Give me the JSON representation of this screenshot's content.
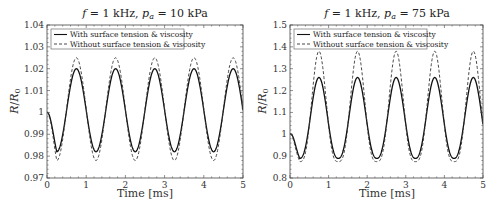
{
  "chart_data": [
    {
      "type": "line",
      "title": "f = 1 kHz, p_a = 10 kPa",
      "title_parts": {
        "f": "f",
        "eq1": " = 1 kHz, ",
        "p": "p",
        "sub": "a",
        "eq2": " = 10 kPa"
      },
      "xlabel": "Time [ms]",
      "ylabel": "R/R0",
      "ylabel_parts": {
        "R": "R",
        "slash": "/",
        "R0": "R",
        "sub": "0"
      },
      "xlim": [
        0,
        5
      ],
      "ylim": [
        0.97,
        1.04
      ],
      "xticks": [
        0,
        1,
        2,
        3,
        4,
        5
      ],
      "xtick_labels": [
        "0",
        "1",
        "2",
        "3",
        "4",
        "5"
      ],
      "yticks": [
        0.97,
        0.98,
        0.99,
        1.0,
        1.01,
        1.02,
        1.03,
        1.04
      ],
      "ytick_labels": [
        "0.97",
        "0.98",
        "0.99",
        "1",
        "1.01",
        "1.02",
        "1.03",
        "1.04"
      ],
      "grid": false,
      "legend_position": "upper left",
      "frequency_khz": 1,
      "period_ms": 1,
      "series": [
        {
          "name": "With surface tension & viscosity",
          "style": "solid",
          "color": "#111111",
          "start": 1.0,
          "min": 0.982,
          "max": 1.02,
          "minima_t": [
            0.25,
            1.25,
            2.25,
            3.25,
            4.25
          ],
          "maxima_t": [
            0.75,
            1.75,
            2.75,
            3.75,
            4.75
          ]
        },
        {
          "name": "Without surface tension & viscosity",
          "style": "dashed",
          "color": "#333333",
          "start": 1.0,
          "min": 0.978,
          "max": 1.025,
          "minima_t": [
            0.25,
            1.25,
            2.25,
            3.25,
            4.25
          ],
          "maxima_t": [
            0.75,
            1.75,
            2.75,
            3.75,
            4.75
          ]
        }
      ]
    },
    {
      "type": "line",
      "title": "f = 1 kHz, p_a = 75 kPa",
      "title_parts": {
        "f": "f",
        "eq1": " = 1 kHz, ",
        "p": "p",
        "sub": "a",
        "eq2": " = 75 kPa"
      },
      "xlabel": "Time [ms]",
      "ylabel": "R/R0",
      "ylabel_parts": {
        "R": "R",
        "slash": "/",
        "R0": "R",
        "sub": "0"
      },
      "xlim": [
        0,
        5
      ],
      "ylim": [
        0.8,
        1.5
      ],
      "xticks": [
        0,
        1,
        2,
        3,
        4,
        5
      ],
      "xtick_labels": [
        "0",
        "1",
        "2",
        "3",
        "4",
        "5"
      ],
      "yticks": [
        0.8,
        0.9,
        1.0,
        1.1,
        1.2,
        1.3,
        1.4,
        1.5
      ],
      "ytick_labels": [
        "0.8",
        "0.9",
        "1",
        "1.1",
        "1.2",
        "1.3",
        "1.4",
        "1.5"
      ],
      "grid": false,
      "legend_position": "upper left",
      "frequency_khz": 1,
      "period_ms": 1,
      "series": [
        {
          "name": "With surface tension & viscosity",
          "style": "solid",
          "color": "#111111",
          "start": 1.0,
          "min": 0.89,
          "max": 1.26,
          "minima_t": [
            0.25,
            1.25,
            2.25,
            3.25,
            4.25
          ],
          "maxima_t": [
            0.75,
            1.75,
            2.75,
            3.75,
            4.75
          ]
        },
        {
          "name": "Without surface tension & viscosity",
          "style": "dashed",
          "color": "#333333",
          "start": 1.0,
          "min": 0.875,
          "max": 1.38,
          "minima_t": [
            0.25,
            1.25,
            2.25,
            3.25,
            4.25
          ],
          "maxima_t": [
            0.75,
            1.75,
            2.75,
            3.75,
            4.75
          ]
        }
      ]
    }
  ]
}
